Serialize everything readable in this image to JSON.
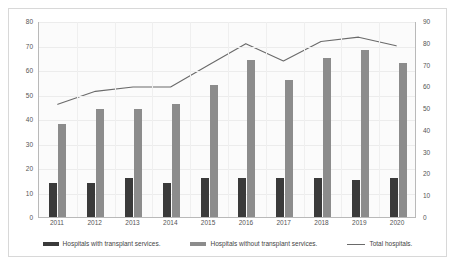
{
  "chart_data": {
    "type": "bar",
    "title": "",
    "subtitle": "",
    "xlabel": "",
    "ylabel": "",
    "categories": [
      "2011",
      "2012",
      "2013",
      "2014",
      "2015",
      "2016",
      "2017",
      "2018",
      "2019",
      "2020"
    ],
    "series": [
      {
        "name": "Hospitals with transplant services.",
        "type": "bar",
        "axis": "left",
        "color": "#3a3a3a",
        "values": [
          14,
          14,
          16,
          14,
          16,
          16,
          16,
          16,
          15,
          16
        ]
      },
      {
        "name": "Hospitals without transplant services.",
        "type": "bar",
        "axis": "left",
        "color": "#8c8c8c",
        "values": [
          38,
          44,
          44,
          46,
          54,
          64,
          56,
          65,
          68,
          63
        ]
      },
      {
        "name": "Total hospitals.",
        "type": "line",
        "axis": "right",
        "color": "#6a6a6a",
        "values": [
          52,
          58,
          60,
          60,
          70,
          80,
          72,
          81,
          83,
          79
        ]
      }
    ],
    "ylim": [
      0,
      80
    ],
    "y_ticks": [
      0,
      10,
      20,
      30,
      40,
      50,
      60,
      70,
      80
    ],
    "y2lim": [
      0,
      90
    ],
    "y2_ticks": [
      0,
      10,
      20,
      30,
      40,
      50,
      60,
      70,
      80,
      90
    ],
    "grid": true,
    "legend_position": "bottom"
  },
  "axes": {
    "left_ticks": [
      "80",
      "70",
      "60",
      "50",
      "40",
      "30",
      "20",
      "10",
      "0"
    ],
    "right_ticks": [
      "90",
      "80",
      "70",
      "60",
      "50",
      "40",
      "30",
      "20",
      "10",
      "0"
    ],
    "x_labels": [
      "2011",
      "2012",
      "2013",
      "2014",
      "2015",
      "2016",
      "2017",
      "2018",
      "2019",
      "2020"
    ]
  },
  "legend": {
    "items": [
      {
        "label": "Hospitals with transplant services.",
        "marker": "bar-dark-swatch"
      },
      {
        "label": "Hospitals without transplant services.",
        "marker": "bar-gray-swatch"
      },
      {
        "label": "Total hospitals.",
        "marker": "line-swatch"
      }
    ]
  },
  "colors": {
    "bar_dark": "#3a3a3a",
    "bar_gray": "#8c8c8c",
    "line": "#6a6a6a",
    "grid": "#ececec",
    "axis": "#b9b9b9",
    "frame": "#d8d8d8",
    "plot_background": "#fbfbfb"
  }
}
